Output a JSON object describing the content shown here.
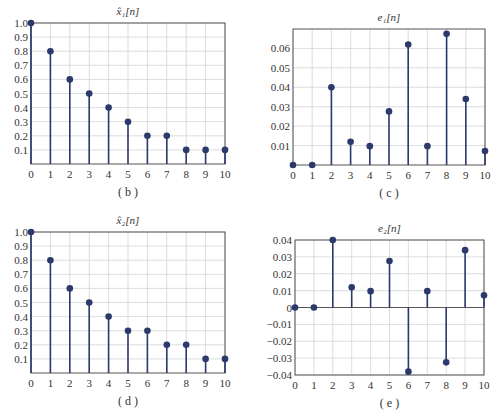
{
  "chart_data": [
    {
      "id": "b",
      "type": "stem",
      "title": "x̂₁[n]",
      "caption": "( b )",
      "x": [
        0,
        1,
        2,
        3,
        4,
        5,
        6,
        7,
        8,
        9,
        10
      ],
      "values": [
        1.0,
        0.8,
        0.6,
        0.5,
        0.4,
        0.3,
        0.2,
        0.2,
        0.1,
        0.1,
        0.1
      ],
      "ylim": [
        0,
        1.0
      ],
      "yticks": [
        0.1,
        0.2,
        0.3,
        0.4,
        0.5,
        0.6,
        0.7,
        0.8,
        0.9,
        1.0
      ],
      "ytick_labels": [
        "0.1",
        "0.2",
        "0.3",
        "0.4",
        "0.5",
        "0.6",
        "0.7",
        "0.8",
        "0.9",
        "1.0"
      ],
      "xticks": [
        0,
        1,
        2,
        3,
        4,
        5,
        6,
        7,
        8,
        9,
        10
      ],
      "grid": true
    },
    {
      "id": "c",
      "type": "stem",
      "title": "e₁[n]",
      "caption": "( c )",
      "x": [
        0,
        1,
        2,
        3,
        4,
        5,
        6,
        7,
        8,
        9,
        10
      ],
      "values": [
        0,
        0,
        0.04,
        0.012,
        0.0097,
        0.0276,
        0.062,
        0.0097,
        0.0675,
        0.034,
        0.0072
      ],
      "ylim": [
        0,
        0.07
      ],
      "yticks": [
        0.01,
        0.02,
        0.03,
        0.04,
        0.05,
        0.06
      ],
      "ytick_labels": [
        "0.01",
        "0.02",
        "0.03",
        "0.04",
        "0.05",
        "0.06"
      ],
      "xticks": [
        0,
        1,
        2,
        3,
        4,
        5,
        6,
        7,
        8,
        9,
        10
      ],
      "grid": true
    },
    {
      "id": "d",
      "type": "stem",
      "title": "x̂₂[n]",
      "caption": "( d )",
      "x": [
        0,
        1,
        2,
        3,
        4,
        5,
        6,
        7,
        8,
        9,
        10
      ],
      "values": [
        1.0,
        0.8,
        0.6,
        0.5,
        0.4,
        0.3,
        0.3,
        0.2,
        0.2,
        0.1,
        0.1
      ],
      "ylim": [
        0,
        1.0
      ],
      "yticks": [
        0.1,
        0.2,
        0.3,
        0.4,
        0.5,
        0.6,
        0.7,
        0.8,
        0.9,
        1.0
      ],
      "ytick_labels": [
        "0.1",
        "0.2",
        "0.3",
        "0.4",
        "0.5",
        "0.6",
        "0.7",
        "0.8",
        "0.9",
        "1.0"
      ],
      "xticks": [
        0,
        1,
        2,
        3,
        4,
        5,
        6,
        7,
        8,
        9,
        10
      ],
      "grid": true
    },
    {
      "id": "e",
      "type": "stem",
      "title": "e₂[n]",
      "caption": "( e )",
      "x": [
        0,
        1,
        2,
        3,
        4,
        5,
        6,
        7,
        8,
        9,
        10
      ],
      "values": [
        0,
        0,
        0.04,
        0.012,
        0.0097,
        0.0276,
        -0.038,
        0.0097,
        -0.0325,
        0.034,
        0.0072
      ],
      "ylim": [
        -0.04,
        0.04
      ],
      "yticks": [
        -0.04,
        -0.03,
        -0.02,
        -0.01,
        0,
        0.01,
        0.02,
        0.03,
        0.04
      ],
      "ytick_labels": [
        "−0.04",
        "−0.03",
        "−0.02",
        "−0.01",
        "0",
        "0.01",
        "0.02",
        "0.03",
        "0.04"
      ],
      "xticks": [
        0,
        1,
        2,
        3,
        4,
        5,
        6,
        7,
        8,
        9,
        10
      ],
      "grid": true
    }
  ],
  "style": {
    "stem_color": "#2b3a6b",
    "grid_color": "#d4d4d4",
    "axis_color": "#555555"
  }
}
